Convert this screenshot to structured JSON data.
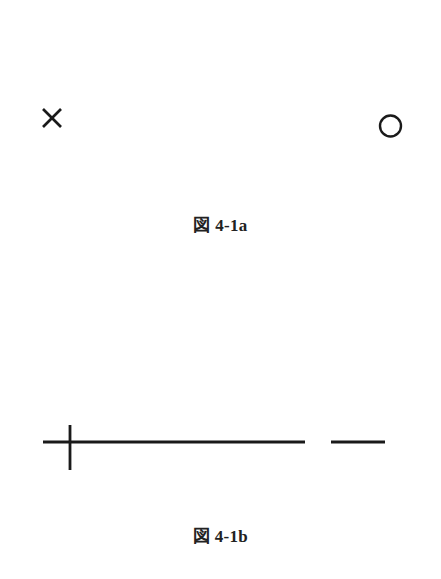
{
  "figures": [
    {
      "id": "4-1a",
      "caption": "図 4-1a",
      "symbols": [
        {
          "name": "cross-mark",
          "glyph": "×"
        },
        {
          "name": "circle-mark",
          "glyph": "○"
        }
      ]
    },
    {
      "id": "4-1b",
      "caption": "図 4-1b",
      "symbols": [
        {
          "name": "plus-line",
          "description": "long horizontal line crossed by a short vertical line near its left end"
        },
        {
          "name": "short-dash",
          "description": "short horizontal line segment"
        }
      ]
    }
  ],
  "colors": {
    "stroke": "#1a1a1a",
    "text": "#222222",
    "background": "#ffffff"
  }
}
